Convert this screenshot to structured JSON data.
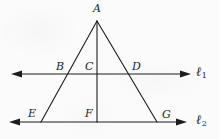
{
  "figure": {
    "type": "geometry-diagram",
    "stroke_color": "#1d1d1d",
    "background_color": "#fbfbfb",
    "points": [
      {
        "id": "A",
        "label": "A",
        "x": 97,
        "y": 21,
        "label_x": 93,
        "label_y": 3
      },
      {
        "id": "B",
        "label": "B",
        "x": 68,
        "y": 74,
        "label_x": 56,
        "label_y": 61
      },
      {
        "id": "C",
        "label": "C",
        "x": 97,
        "y": 74,
        "label_x": 85,
        "label_y": 61
      },
      {
        "id": "D",
        "label": "D",
        "x": 130,
        "y": 74,
        "label_x": 132,
        "label_y": 61
      },
      {
        "id": "E",
        "label": "E",
        "x": 41,
        "y": 122,
        "label_x": 28,
        "label_y": 108
      },
      {
        "id": "F",
        "label": "F",
        "x": 97,
        "y": 122,
        "label_x": 85,
        "label_y": 108
      },
      {
        "id": "G",
        "label": "G",
        "x": 157,
        "y": 122,
        "label_x": 162,
        "label_y": 109
      }
    ],
    "lines": [
      {
        "id": "l1",
        "label": "ℓ",
        "subscript": "1",
        "y": 74,
        "x_start": 12,
        "x_end": 190,
        "label_x": 196,
        "label_y": 66,
        "arrows": "both"
      },
      {
        "id": "l2",
        "label": "ℓ",
        "subscript": "2",
        "y": 122,
        "x_start": 10,
        "x_end": 186,
        "label_x": 196,
        "label_y": 114,
        "arrows": "both"
      }
    ],
    "segments": [
      {
        "id": "left-leg",
        "from": "A",
        "to": "E",
        "x1": 97,
        "y1": 21,
        "x2": 41,
        "y2": 122
      },
      {
        "id": "right-leg",
        "from": "A",
        "to": "G",
        "x1": 97,
        "y1": 21,
        "x2": 157,
        "y2": 122
      },
      {
        "id": "altitude",
        "from": "A",
        "to": "F",
        "x1": 97,
        "y1": 21,
        "x2": 97,
        "y2": 122
      }
    ]
  }
}
